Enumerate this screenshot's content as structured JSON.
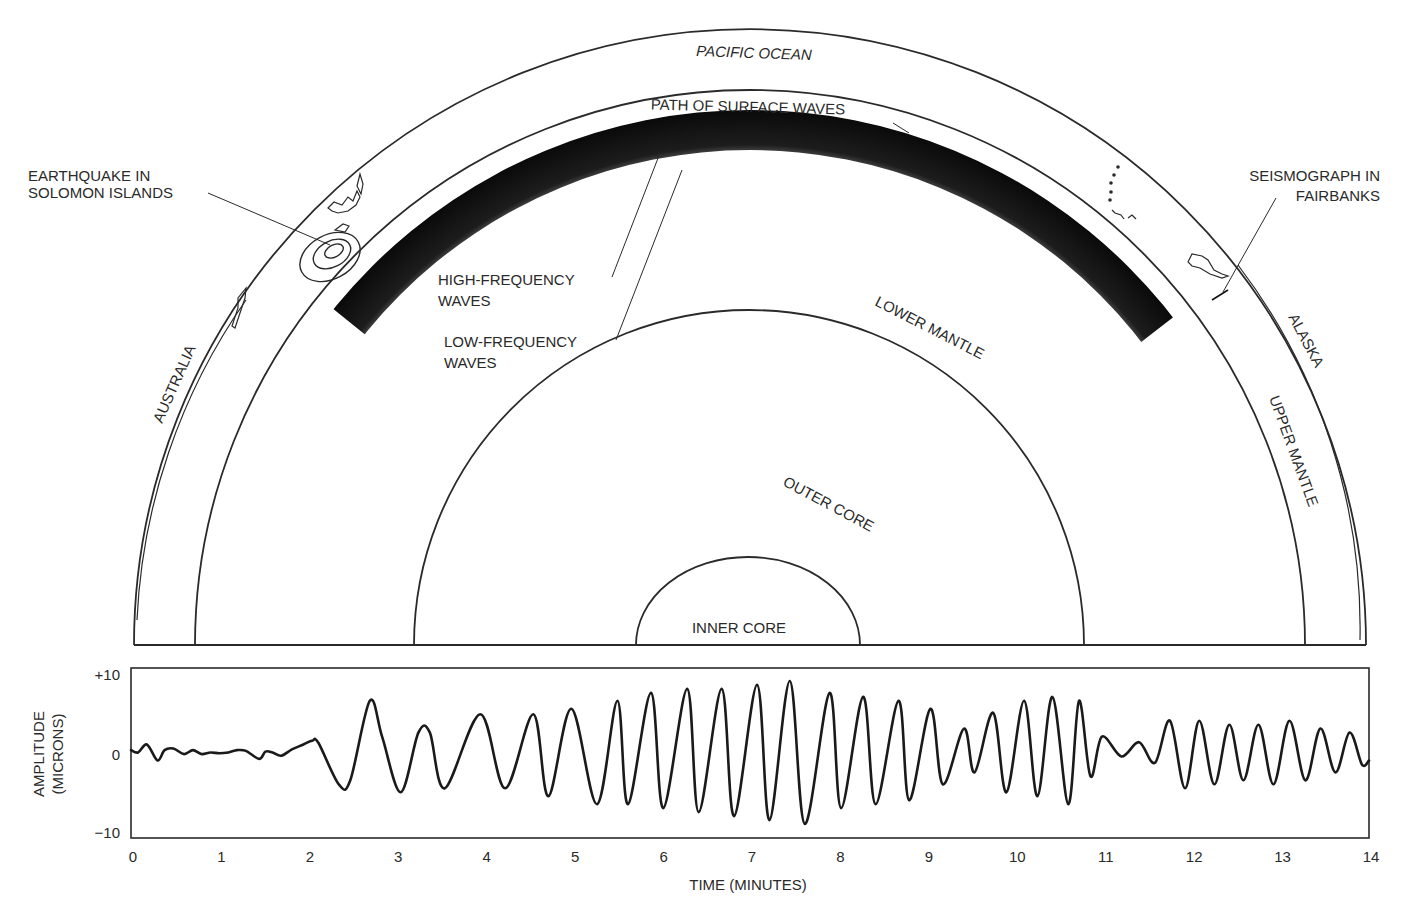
{
  "diagram": {
    "title_labels": {
      "pacific_ocean": "PACIFIC OCEAN",
      "path_of_surface_waves": "PATH OF SURFACE WAVES",
      "earthquake_line1": "EARTHQUAKE IN",
      "earthquake_line2": "SOLOMON ISLANDS",
      "seismograph_line1": "SEISMOGRAPH IN",
      "seismograph_line2": "FAIRBANKS",
      "high_freq_line1": "HIGH-FREQUENCY",
      "high_freq_line2": "WAVES",
      "low_freq_line1": "LOW-FREQUENCY",
      "low_freq_line2": "WAVES",
      "australia": "AUSTRALIA",
      "alaska": "ALASKA",
      "upper_mantle": "UPPER MANTLE",
      "lower_mantle": "LOWER MANTLE",
      "outer_core": "OUTER CORE",
      "inner_core": "INNER CORE"
    },
    "layers": [
      {
        "name": "crust / surface",
        "radius_px": 616
      },
      {
        "name": "upper mantle boundary",
        "radius_px": 555
      },
      {
        "name": "outer core boundary",
        "radius_px": 335
      },
      {
        "name": "inner core boundary",
        "radius_px": 112
      }
    ],
    "colors": {
      "ink": "#2a2a2a",
      "band": "#111111",
      "background": "#ffffff"
    }
  },
  "chart_data": {
    "type": "line",
    "xlabel": "TIME (MINUTES)",
    "ylabel": "AMPLITUDE (MICRONS)",
    "xlim": [
      0,
      14
    ],
    "ylim": [
      -10,
      10
    ],
    "x_ticks": [
      "0",
      "1",
      "2",
      "3",
      "4",
      "5",
      "6",
      "7",
      "8",
      "9",
      "10",
      "11",
      "12",
      "13",
      "14"
    ],
    "y_ticks": [
      "+10",
      "0",
      "−10"
    ],
    "grid": false,
    "legend": null,
    "series": [
      {
        "name": "ground motion",
        "x": [
          0.0,
          0.08,
          0.18,
          0.3,
          0.38,
          0.48,
          0.6,
          0.7,
          0.8,
          0.9,
          1.0,
          1.1,
          1.2,
          1.3,
          1.45,
          1.52,
          1.6,
          1.7,
          1.82,
          1.95,
          2.05,
          2.12,
          2.35,
          2.48,
          2.7,
          2.84,
          3.05,
          3.25,
          3.38,
          3.55,
          3.95,
          4.23,
          4.55,
          4.72,
          4.98,
          5.27,
          5.5,
          5.62,
          5.88,
          6.02,
          6.29,
          6.42,
          6.68,
          6.82,
          7.08,
          7.22,
          7.45,
          7.62,
          7.9,
          8.03,
          8.28,
          8.42,
          8.68,
          8.8,
          9.04,
          9.18,
          9.42,
          9.54,
          9.75,
          9.9,
          10.1,
          10.25,
          10.42,
          10.6,
          10.72,
          10.85,
          10.98,
          11.2,
          11.4,
          11.58,
          11.75,
          11.92,
          12.08,
          12.25,
          12.42,
          12.58,
          12.75,
          12.92,
          13.1,
          13.28,
          13.45,
          13.62,
          13.78,
          13.92,
          14.0
        ],
        "values": [
          0.3,
          0.0,
          1.0,
          -1.0,
          0.3,
          0.5,
          -0.2,
          0.3,
          -0.2,
          0.0,
          -0.1,
          0.0,
          0.3,
          0.2,
          -0.8,
          0.1,
          0.0,
          -0.4,
          0.4,
          1.0,
          1.5,
          1.2,
          -4.0,
          -3.5,
          6.5,
          2.0,
          -5.0,
          2.5,
          2.5,
          -4.5,
          4.8,
          -4.5,
          4.8,
          -5.5,
          5.5,
          -6.5,
          6.5,
          -6.5,
          7.5,
          -7.0,
          8.0,
          -7.5,
          8.0,
          -8.0,
          8.5,
          -8.5,
          9.0,
          -9.0,
          7.5,
          -7.0,
          7.0,
          -6.5,
          6.5,
          -6.0,
          5.5,
          -4.0,
          3.0,
          -2.5,
          5.0,
          -5.0,
          6.5,
          -5.5,
          7.0,
          -6.5,
          6.5,
          -3.0,
          2.0,
          -0.5,
          1.3,
          -1.3,
          4.0,
          -4.5,
          4.0,
          -4.0,
          3.5,
          -3.5,
          3.5,
          -4.0,
          4.0,
          -3.5,
          3.0,
          -2.5,
          2.5,
          -1.5,
          -1.0
        ]
      }
    ]
  }
}
